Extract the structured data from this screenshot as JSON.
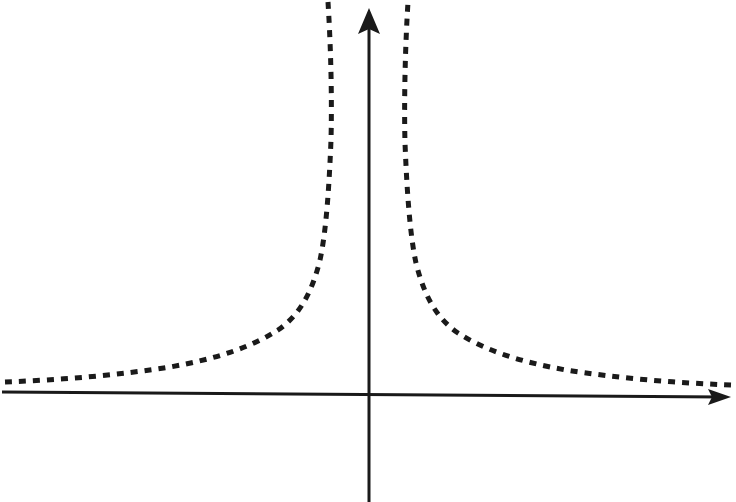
{
  "figure": {
    "title": "",
    "background_color": "#ffffff",
    "width": 736,
    "height": 502,
    "ink_color": "#1a1a1a"
  },
  "axes": {
    "x_axis": {
      "name": "horizontal-axis",
      "label": "",
      "has_arrow_head": true,
      "arrow_direction": "right",
      "start_px": [
        2,
        392
      ],
      "end_px": [
        731,
        397
      ],
      "stroke_width": 3,
      "tick_labels": []
    },
    "y_axis": {
      "name": "vertical-axis",
      "label": "",
      "has_arrow_head": true,
      "arrow_direction": "up",
      "start_px": [
        369,
        502
      ],
      "end_px": [
        369,
        10
      ],
      "stroke_width": 3,
      "tick_labels": []
    },
    "origin_px": [
      369,
      395
    ]
  },
  "curve": {
    "style": "dashed",
    "dash_pattern": "7 7",
    "stroke_width": 5,
    "color": "#1a1a1a",
    "description": "even reciprocal-power curve with vertical asymptote at x = 0 and horizontal asymptote y = 0",
    "branches": [
      "left",
      "right"
    ]
  },
  "chart_data": {
    "type": "line",
    "title": "",
    "subtitle": "",
    "xlabel": "",
    "ylabel": "",
    "grid": false,
    "legend_position": "none",
    "annotations": [],
    "xlim": [
      -6.0,
      6.0
    ],
    "ylim": [
      0,
      8.0
    ],
    "asymptotes": {
      "vertical": [
        0
      ],
      "horizontal": [
        0
      ]
    },
    "series": [
      {
        "name": "left-branch",
        "style": "dashed",
        "x": [
          -6.0,
          -5.5,
          -5.0,
          -4.5,
          -4.0,
          -3.5,
          -3.0,
          -2.6,
          -2.2,
          -1.9,
          -1.6,
          -1.4,
          -1.2,
          -1.05,
          -0.9,
          -0.8,
          -0.7,
          -0.62,
          -0.55,
          -0.5,
          -0.46,
          -0.43,
          -0.41
        ],
        "y": [
          0.11,
          0.13,
          0.16,
          0.2,
          0.25,
          0.33,
          0.44,
          0.59,
          0.83,
          1.11,
          1.56,
          2.04,
          2.78,
          3.63,
          4.94,
          6.25,
          7.5,
          8.0,
          8.6,
          9.2,
          9.7,
          10.1,
          10.4
        ]
      },
      {
        "name": "right-branch",
        "style": "dashed",
        "x": [
          0.41,
          0.43,
          0.46,
          0.5,
          0.55,
          0.62,
          0.7,
          0.8,
          0.9,
          1.05,
          1.2,
          1.4,
          1.6,
          1.9,
          2.2,
          2.6,
          3.0,
          3.5,
          4.0,
          4.5,
          5.0,
          5.5,
          6.0
        ],
        "y": [
          10.4,
          10.1,
          9.7,
          9.2,
          8.6,
          8.0,
          7.5,
          6.25,
          4.94,
          3.63,
          2.78,
          2.04,
          1.56,
          1.11,
          0.83,
          0.59,
          0.44,
          0.33,
          0.25,
          0.2,
          0.16,
          0.13,
          0.11
        ]
      }
    ]
  },
  "accessibility": {
    "alt_text": "Dashed curve with two symmetric branches rising steeply toward a vertical asymptote along the y-axis and flattening toward the horizontal x-axis on both sides."
  }
}
